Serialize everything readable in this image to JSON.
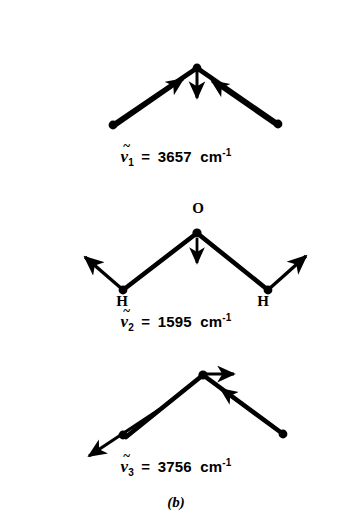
{
  "figure": {
    "caption": "(b)",
    "background_color": "#ffffff",
    "ink_color": "#000000",
    "molecule": "H2O",
    "panels": [
      {
        "name": "symmetric-stretch",
        "label": {
          "symbol": "ν",
          "tilde": "~",
          "subscript": "1",
          "equals": "=",
          "value": "3657",
          "unit": "cm",
          "unit_exponent": "-1",
          "text": "ν̃1 = 3657 cm-1"
        },
        "atoms": [
          {
            "element": "",
            "x": 113,
            "y": 125
          },
          {
            "element": "",
            "x": 197,
            "y": 68
          },
          {
            "element": "",
            "x": 278,
            "y": 124
          }
        ],
        "arrows": [
          {
            "from": [
              113,
              125
            ],
            "to": [
              182,
              78
            ],
            "direction": "inward-up-right"
          },
          {
            "from": [
              197,
              73
            ],
            "to": [
              197,
              101
            ],
            "direction": "down"
          },
          {
            "from": [
              278,
              124
            ],
            "to": [
              212,
              80
            ],
            "direction": "inward-up-left"
          }
        ]
      },
      {
        "name": "bend",
        "label": {
          "symbol": "ν",
          "tilde": "~",
          "subscript": "2",
          "equals": "=",
          "value": "1595",
          "unit": "cm",
          "unit_exponent": "-1",
          "text": "ν̃2 = 1595 cm-1"
        },
        "atom_labels": {
          "oxygen": "O",
          "hydrogen_left": "H",
          "hydrogen_right": "H"
        },
        "atoms": [
          {
            "element": "H",
            "x": 123,
            "y": 290
          },
          {
            "element": "O",
            "x": 197,
            "y": 233
          },
          {
            "element": "H",
            "x": 268,
            "y": 290
          }
        ],
        "arrows": [
          {
            "from": [
              123,
              290
            ],
            "to": [
              82,
              255
            ],
            "direction": "outward-up-left"
          },
          {
            "from": [
              197,
              238
            ],
            "to": [
              197,
              266
            ],
            "direction": "down"
          },
          {
            "from": [
              268,
              290
            ],
            "to": [
              309,
              253
            ],
            "direction": "outward-up-right"
          }
        ]
      },
      {
        "name": "asymmetric-stretch",
        "label": {
          "symbol": "ν",
          "tilde": "~",
          "subscript": "3",
          "equals": "=",
          "value": "3756",
          "unit": "cm",
          "unit_exponent": "-1",
          "text": "ν̃3 = 3756 cm-1"
        },
        "atoms": [
          {
            "element": "",
            "x": 123,
            "y": 435
          },
          {
            "element": "",
            "x": 203,
            "y": 375
          },
          {
            "element": "",
            "x": 283,
            "y": 434
          }
        ],
        "arrows": [
          {
            "from": [
              123,
              435
            ],
            "to": [
              88,
              457
            ],
            "direction": "outward-down-left"
          },
          {
            "from": [
              203,
              375
            ],
            "to": [
              236,
              375
            ],
            "direction": "right"
          },
          {
            "from": [
              283,
              434
            ],
            "to": [
              219,
              388
            ],
            "direction": "inward-up-left"
          }
        ]
      }
    ]
  }
}
